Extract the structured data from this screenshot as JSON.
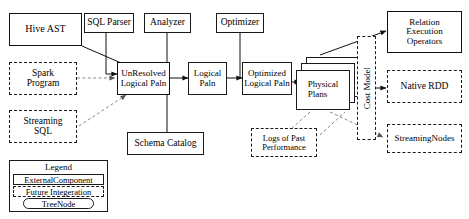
{
  "figure": {
    "caption_fragment": ""
  },
  "nodes": {
    "hive_ast": {
      "label": "Hive AST",
      "style": "solid"
    },
    "sql_parser": {
      "label": "SQL Parser",
      "style": "solid"
    },
    "analyzer": {
      "label": "Analyzer",
      "style": "solid"
    },
    "optimizer": {
      "label": "Optimizer",
      "style": "solid"
    },
    "spark_program": {
      "label": "Spark\nProgram",
      "style": "dashed"
    },
    "streaming_sql": {
      "label": "Streaming\nSQL",
      "style": "dashed"
    },
    "unresolved_logical_plan": {
      "label": "UnResolved\nLogical Paln",
      "style": "solid"
    },
    "logical_plan": {
      "label": "Logical\nPaln",
      "style": "solid"
    },
    "optimized_logical_plan": {
      "label": "Optimized\nLogical Paln",
      "style": "solid"
    },
    "physical_plans": {
      "label": "Physical\nPlans",
      "style": "stacked-solid"
    },
    "schema_catalog": {
      "label": "Schema Catalog",
      "style": "solid"
    },
    "logs_of_past_performance": {
      "label": "Logs of Past\nPerformance",
      "style": "dashed"
    },
    "cost_model": {
      "label": "Cost Model",
      "style": "dashed-vertical"
    },
    "relation_execution_operators": {
      "label": "Relation\nExecution\nOperators",
      "style": "solid"
    },
    "native_rdd": {
      "label": "Native RDD",
      "style": "dashed"
    },
    "streaming_nodes": {
      "label": "StreamingNodes",
      "style": "dashed"
    }
  },
  "legend": {
    "title": "Legend",
    "items": [
      {
        "label": "ExternalComponent",
        "style": "solid"
      },
      {
        "label": "Future Integeration",
        "style": "dashed"
      },
      {
        "label": "TreeNode",
        "style": "rounded"
      }
    ]
  },
  "colors": {
    "stroke": "#1a1a1a",
    "background": "#ffffff",
    "text": "#000000",
    "faint": "#9a9a9a"
  }
}
